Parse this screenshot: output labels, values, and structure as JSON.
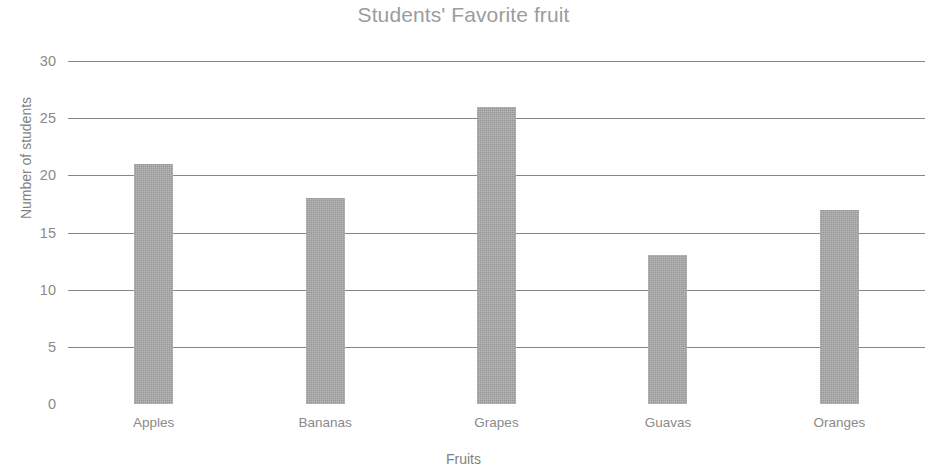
{
  "chart_data": {
    "type": "bar",
    "title": "Students' Favorite fruit",
    "xlabel": "Fruits",
    "ylabel": "Number of students",
    "categories": [
      "Apples",
      "Bananas",
      "Grapes",
      "Guavas",
      "Oranges"
    ],
    "values": [
      21,
      18,
      26,
      13,
      17
    ],
    "ylim": [
      0,
      30
    ],
    "yticks": [
      0,
      5,
      10,
      15,
      20,
      25,
      30
    ],
    "ytick_labels": [
      "0",
      "5",
      "10",
      "15",
      "20",
      "25",
      "30"
    ],
    "grid": true,
    "grid_axis": "y",
    "legend": false,
    "bar_color": "#a6a6a6",
    "gridline_color": "#868686",
    "title_color": "#9c9c9c",
    "label_color": "#8a8a8a",
    "background_color": "#ffffff"
  }
}
